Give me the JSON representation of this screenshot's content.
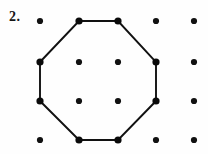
{
  "figure": {
    "problem_number": "2.",
    "caption": "",
    "background_color": "#fefefe",
    "ink_color": "#111111"
  },
  "chart_data": {
    "type": "scatter",
    "title": "",
    "subtitle": "",
    "xlabel": "",
    "ylabel": "",
    "grid": false,
    "legend": null,
    "xlim": [
      0,
      4
    ],
    "ylim": [
      0,
      3
    ],
    "columns": 5,
    "rows": 4,
    "column_pixels": [
      40,
      79,
      118,
      156,
      194
    ],
    "row_pixels": [
      21,
      62,
      101,
      140
    ],
    "dot_radius": 3.1,
    "vertex_dot_radius": 3.6,
    "lattice_points": [
      {
        "col": 0,
        "row": 0,
        "x": 40,
        "y": 21,
        "on_shape": false
      },
      {
        "col": 1,
        "row": 0,
        "x": 79,
        "y": 21,
        "on_shape": true
      },
      {
        "col": 2,
        "row": 0,
        "x": 118,
        "y": 21,
        "on_shape": true
      },
      {
        "col": 3,
        "row": 0,
        "x": 156,
        "y": 21,
        "on_shape": false
      },
      {
        "col": 4,
        "row": 0,
        "x": 194,
        "y": 21,
        "on_shape": false
      },
      {
        "col": 0,
        "row": 1,
        "x": 40,
        "y": 62,
        "on_shape": true
      },
      {
        "col": 1,
        "row": 1,
        "x": 79,
        "y": 62,
        "on_shape": false
      },
      {
        "col": 2,
        "row": 1,
        "x": 118,
        "y": 62,
        "on_shape": false
      },
      {
        "col": 3,
        "row": 1,
        "x": 156,
        "y": 62,
        "on_shape": true
      },
      {
        "col": 4,
        "row": 1,
        "x": 194,
        "y": 62,
        "on_shape": false
      },
      {
        "col": 0,
        "row": 2,
        "x": 40,
        "y": 101,
        "on_shape": true
      },
      {
        "col": 1,
        "row": 2,
        "x": 79,
        "y": 101,
        "on_shape": false
      },
      {
        "col": 2,
        "row": 2,
        "x": 118,
        "y": 101,
        "on_shape": false
      },
      {
        "col": 3,
        "row": 2,
        "x": 156,
        "y": 101,
        "on_shape": true
      },
      {
        "col": 4,
        "row": 2,
        "x": 194,
        "y": 101,
        "on_shape": false
      },
      {
        "col": 0,
        "row": 3,
        "x": 40,
        "y": 140,
        "on_shape": false
      },
      {
        "col": 1,
        "row": 3,
        "x": 79,
        "y": 140,
        "on_shape": true
      },
      {
        "col": 2,
        "row": 3,
        "x": 118,
        "y": 140,
        "on_shape": true
      },
      {
        "col": 3,
        "row": 3,
        "x": 156,
        "y": 140,
        "on_shape": false
      },
      {
        "col": 4,
        "row": 3,
        "x": 194,
        "y": 140,
        "on_shape": false
      }
    ],
    "shape": {
      "name": "octagon",
      "closed": true,
      "stroke_width": 1.9,
      "stroke_color": "#111111",
      "fill": "none",
      "vertices": [
        {
          "x": 79,
          "y": 21
        },
        {
          "x": 118,
          "y": 21
        },
        {
          "x": 156,
          "y": 62
        },
        {
          "x": 156,
          "y": 101
        },
        {
          "x": 118,
          "y": 140
        },
        {
          "x": 79,
          "y": 140
        },
        {
          "x": 40,
          "y": 101
        },
        {
          "x": 40,
          "y": 62
        }
      ]
    }
  }
}
